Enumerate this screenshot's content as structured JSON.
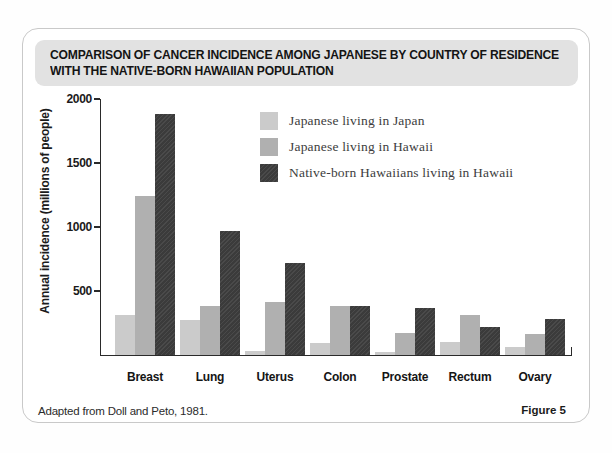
{
  "figure": {
    "title_line1": "COMPARISON OF CANCER INCIDENCE AMONG JAPANESE BY COUNTRY OF RESIDENCE",
    "title_line2": "WITH THE NATIVE-BORN HAWAIIAN POPULATION",
    "source_note": "Adapted from Doll and Peto, 1981.",
    "figure_label": "Figure 5"
  },
  "chart_data": {
    "type": "bar",
    "title": "Comparison of cancer incidence among Japanese by country of residence with the native-born Hawaiian population",
    "xlabel": "",
    "ylabel": "Annual incidence (millions of people)",
    "ylim": [
      0,
      2000
    ],
    "yticks": [
      500,
      1000,
      1500,
      2000
    ],
    "grid": false,
    "legend_position": "inside-top-right",
    "categories": [
      "Breast",
      "Lung",
      "Uterus",
      "Colon",
      "Prostate",
      "Rectum",
      "Ovary"
    ],
    "series": [
      {
        "name": "Japanese living in Japan",
        "color": "#cbcbcb",
        "values": [
          310,
          270,
          35,
          90,
          20,
          105,
          60
        ]
      },
      {
        "name": "Japanese living in Hawaii",
        "color": "#b0b0b0",
        "values": [
          1240,
          385,
          415,
          385,
          170,
          310,
          165
        ]
      },
      {
        "name": "Native-born Hawaiians living in Hawaii",
        "color": "#3b3b3b",
        "values": [
          1880,
          970,
          720,
          380,
          365,
          215,
          285
        ]
      }
    ],
    "source": "Adapted from Doll and Peto, 1981."
  },
  "colors": {
    "title_band_bg": "#e2e2e2",
    "axis": "#2a2a2a",
    "frame_border": "#c9c9c9",
    "series_light": "#cbcbcb",
    "series_medium": "#b0b0b0",
    "series_dark": "#3b3b3b"
  }
}
